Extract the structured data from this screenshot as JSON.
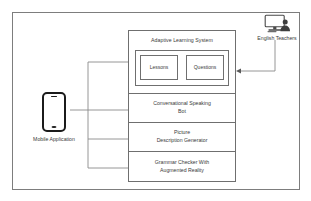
{
  "diagram": {
    "stroke_color": "#6f6f6f",
    "text_color": "#3a3a3a",
    "phone_color": "#1b1b1b",
    "background": "#ffffff"
  },
  "actors": {
    "mobile": {
      "label": "Mobile Application",
      "icon": "mobile-phone-icon"
    },
    "teachers": {
      "label": "English Teachers",
      "icon": "desktop-user-icon"
    }
  },
  "modules": [
    {
      "id": "adaptive-learning-system",
      "label": "Adaptive Learning System",
      "children": [
        {
          "id": "lessons",
          "label": "Lessons"
        },
        {
          "id": "questions",
          "label": "Questions"
        }
      ]
    },
    {
      "id": "conversational-speaking-bot",
      "line1": "Conversational Speaking",
      "line2": "Bot"
    },
    {
      "id": "picture-description-generator",
      "line1": "Picture",
      "line2": "Description Generator"
    },
    {
      "id": "grammar-checker-ar",
      "line1": "Grammar Checker With",
      "line2": "Augmented Reality"
    }
  ]
}
